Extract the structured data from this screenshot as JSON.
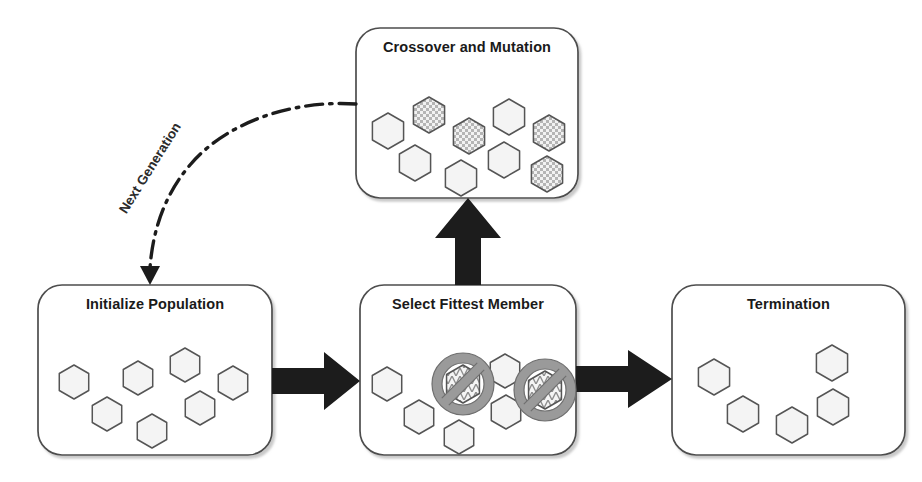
{
  "diagram": {
    "type": "flowchart",
    "canvas": {
      "width": 922,
      "height": 482
    },
    "palette": {
      "box_stroke": "#4d4d4d",
      "box_fill": "#ffffff",
      "arrow_fill": "#1c1c1c",
      "hex_stroke": "#555555",
      "hex_fill": "#f4f4f4",
      "hex_pattern_fill": "#cfcfcf",
      "ban_circle": "#9a9a9a",
      "text": "#1a1a1a"
    }
  },
  "nodes": [
    {
      "id": "initialize-population",
      "label": "Initialize Population",
      "rect": {
        "x": 38,
        "y": 285,
        "w": 234,
        "h": 170
      },
      "title_y": 305,
      "hex_count": 7,
      "hexagons": [
        {
          "cx": 74,
          "cy": 382,
          "r": 17,
          "pattern": "plain"
        },
        {
          "cx": 138,
          "cy": 378,
          "r": 17,
          "pattern": "plain"
        },
        {
          "cx": 185,
          "cy": 365,
          "r": 17,
          "pattern": "plain"
        },
        {
          "cx": 233,
          "cy": 383,
          "r": 17,
          "pattern": "plain"
        },
        {
          "cx": 107,
          "cy": 414,
          "r": 17,
          "pattern": "plain"
        },
        {
          "cx": 152,
          "cy": 431,
          "r": 17,
          "pattern": "plain"
        },
        {
          "cx": 200,
          "cy": 408,
          "r": 17,
          "pattern": "plain"
        }
      ]
    },
    {
      "id": "select-fittest-member",
      "label": "Select Fittest Member",
      "rect": {
        "x": 360,
        "y": 285,
        "w": 216,
        "h": 170
      },
      "title_y": 305,
      "hex_count": 7,
      "hexagons": [
        {
          "cx": 387,
          "cy": 384,
          "r": 17,
          "pattern": "plain"
        },
        {
          "cx": 419,
          "cy": 417,
          "r": 17,
          "pattern": "plain"
        },
        {
          "cx": 459,
          "cy": 437,
          "r": 17,
          "pattern": "plain"
        },
        {
          "cx": 505,
          "cy": 371,
          "r": 17,
          "pattern": "plain"
        },
        {
          "cx": 506,
          "cy": 412,
          "r": 17,
          "pattern": "plain"
        },
        {
          "cx": 463,
          "cy": 384,
          "r": 19,
          "pattern": "dna"
        },
        {
          "cx": 545,
          "cy": 390,
          "r": 19,
          "pattern": "dna"
        }
      ],
      "banned": [
        {
          "cx": 463,
          "cy": 384,
          "r": 31
        },
        {
          "cx": 545,
          "cy": 390,
          "r": 31
        }
      ],
      "banned_count": 2
    },
    {
      "id": "termination",
      "label": "Termination",
      "rect": {
        "x": 672,
        "y": 285,
        "w": 233,
        "h": 170
      },
      "title_y": 305,
      "hex_count": 5,
      "hexagons": [
        {
          "cx": 714,
          "cy": 377,
          "r": 18,
          "pattern": "plain"
        },
        {
          "cx": 743,
          "cy": 414,
          "r": 18,
          "pattern": "plain"
        },
        {
          "cx": 792,
          "cy": 425,
          "r": 18,
          "pattern": "plain"
        },
        {
          "cx": 832,
          "cy": 363,
          "r": 18,
          "pattern": "plain"
        },
        {
          "cx": 833,
          "cy": 407,
          "r": 18,
          "pattern": "plain"
        }
      ]
    },
    {
      "id": "crossover-and-mutation",
      "label": "Crossover and Mutation",
      "rect": {
        "x": 356,
        "y": 28,
        "w": 222,
        "h": 170
      },
      "title_y": 48,
      "hex_count": 9,
      "hexagons": [
        {
          "cx": 388,
          "cy": 131,
          "r": 18,
          "pattern": "plain"
        },
        {
          "cx": 429,
          "cy": 115,
          "r": 18,
          "pattern": "checker"
        },
        {
          "cx": 469,
          "cy": 136,
          "r": 18,
          "pattern": "checker"
        },
        {
          "cx": 509,
          "cy": 117,
          "r": 18,
          "pattern": "plain"
        },
        {
          "cx": 549,
          "cy": 133,
          "r": 18,
          "pattern": "checker"
        },
        {
          "cx": 415,
          "cy": 163,
          "r": 18,
          "pattern": "plain"
        },
        {
          "cx": 461,
          "cy": 178,
          "r": 18,
          "pattern": "plain"
        },
        {
          "cx": 504,
          "cy": 160,
          "r": 18,
          "pattern": "plain"
        },
        {
          "cx": 547,
          "cy": 174,
          "r": 18,
          "pattern": "checker"
        }
      ]
    }
  ],
  "connectors": [
    {
      "id": "init-to-select",
      "type": "block-arrow",
      "direction": "right",
      "from": "initialize-population",
      "to": "select-fittest-member",
      "label": ""
    },
    {
      "id": "select-to-termination",
      "type": "block-arrow",
      "direction": "right",
      "from": "select-fittest-member",
      "to": "termination",
      "label": ""
    },
    {
      "id": "select-to-crossover",
      "type": "block-arrow",
      "direction": "up",
      "from": "select-fittest-member",
      "to": "crossover-and-mutation",
      "label": ""
    },
    {
      "id": "crossover-to-init",
      "type": "dash-dot-curve",
      "direction": "down-left",
      "from": "crossover-and-mutation",
      "to": "initialize-population",
      "label": "Next Generation",
      "label_x": 150,
      "label_y": 168,
      "label_rotation": -58
    }
  ]
}
